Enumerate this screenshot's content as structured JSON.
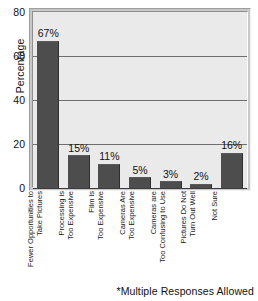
{
  "chart_data": {
    "type": "bar",
    "title": "",
    "subtitle": "",
    "xlabel": "",
    "ylabel": "Percentage",
    "ylim": [
      0,
      80
    ],
    "yticks": [
      0,
      20,
      40,
      60,
      80
    ],
    "ytick_labels": [
      "0",
      "20",
      "40",
      "60",
      "80"
    ],
    "grid": true,
    "legend": false,
    "categories": [
      "Fewer Opportunities to Take Pictures",
      "Processing is Too Expensive",
      "Film is Too Expensive",
      "Cameras Are Too Expensive",
      "Cameras are Too Confusing to Use",
      "Pictures Do Not Turn Out Well",
      "Not Sure"
    ],
    "category_lines": [
      [
        "Fewer Opportunities to",
        "Take Pictures"
      ],
      [
        "Processing is",
        "Too Expensive"
      ],
      [
        "Film is",
        "Too Expensive"
      ],
      [
        "Cameras Are",
        "Too Expensive"
      ],
      [
        "Cameras are",
        "Too Confusing to Use"
      ],
      [
        "Pictures Do Not",
        "Turn Out Well"
      ],
      [
        "Not Sure",
        ""
      ]
    ],
    "values": [
      67,
      15,
      11,
      5,
      3,
      2,
      16
    ],
    "value_labels": [
      "67%",
      "15%",
      "11%",
      "5%",
      "3%",
      "2%",
      "16%"
    ],
    "annotations": [
      "*Multiple Responses Allowed"
    ],
    "colors": {
      "bar": "#4d4d4d",
      "plot_background": "#eaeaea",
      "grid": "#6e6e6e",
      "axis": "#3d3d3d",
      "text": "#111111",
      "frame": "#c8c8c8"
    }
  },
  "footnote": "*Multiple Responses Allowed"
}
